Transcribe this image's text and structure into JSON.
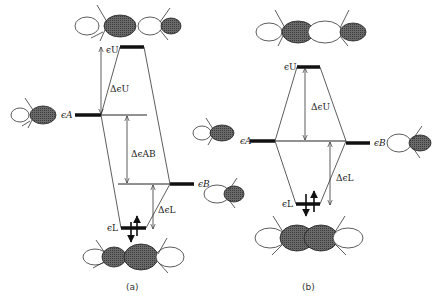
{
  "diagram": {
    "panels": [
      {
        "id": "a",
        "caption": "(a)",
        "levels": {
          "eps_U": "ϵU",
          "eps_A": "ϵA",
          "eps_B": "ϵB",
          "eps_L": "ϵL"
        },
        "gaps": {
          "delta_U": "ΔϵU",
          "delta_AB": "ΔϵAB",
          "delta_L": "ΔϵL"
        }
      },
      {
        "id": "b",
        "caption": "(b)",
        "levels": {
          "eps_U": "ϵU",
          "eps_A": "ϵA",
          "eps_B": "ϵB",
          "eps_L": "ϵL"
        },
        "gaps": {
          "delta_U": "ΔϵU",
          "delta_L": "ΔϵL"
        }
      }
    ],
    "colors": {
      "line": "#333333",
      "lobe_dark": "#555555",
      "lobe_light": "#ffffff"
    }
  }
}
